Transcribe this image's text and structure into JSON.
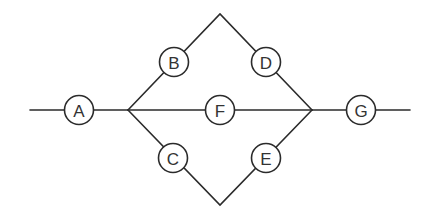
{
  "diagram": {
    "type": "network",
    "colors": {
      "line": "#2b2b2b",
      "node_fill": "#ffffff",
      "label": "#333333",
      "background": "#ffffff"
    },
    "node_radius": 14.5,
    "nodes": [
      {
        "id": "A",
        "label": "A",
        "x": 79,
        "y": 110
      },
      {
        "id": "B",
        "label": "B",
        "x": 174,
        "y": 62
      },
      {
        "id": "C",
        "label": "C",
        "x": 173,
        "y": 158
      },
      {
        "id": "D",
        "label": "D",
        "x": 266,
        "y": 62
      },
      {
        "id": "E",
        "label": "E",
        "x": 266,
        "y": 158
      },
      {
        "id": "F",
        "label": "F",
        "x": 220,
        "y": 110
      },
      {
        "id": "G",
        "label": "G",
        "x": 361,
        "y": 110
      }
    ],
    "junctions": [
      {
        "id": "J1",
        "x": 128,
        "y": 110
      },
      {
        "id": "J2",
        "x": 312,
        "y": 110
      },
      {
        "id": "top",
        "x": 220,
        "y": 14
      },
      {
        "id": "bottom",
        "x": 220,
        "y": 205
      }
    ],
    "edges": [
      {
        "from": "start",
        "to": "A"
      },
      {
        "from": "A",
        "to": "J1"
      },
      {
        "from": "J1",
        "to": "B"
      },
      {
        "from": "B",
        "to": "top"
      },
      {
        "from": "top",
        "to": "D"
      },
      {
        "from": "D",
        "to": "J2"
      },
      {
        "from": "J1",
        "to": "F"
      },
      {
        "from": "F",
        "to": "J2"
      },
      {
        "from": "J1",
        "to": "C"
      },
      {
        "from": "C",
        "to": "bottom"
      },
      {
        "from": "bottom",
        "to": "E"
      },
      {
        "from": "E",
        "to": "J2"
      },
      {
        "from": "J2",
        "to": "G"
      },
      {
        "from": "G",
        "to": "end"
      }
    ]
  }
}
